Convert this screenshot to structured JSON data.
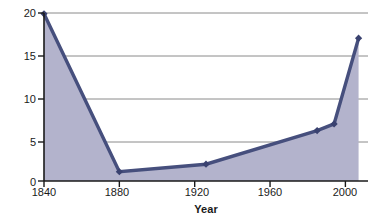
{
  "chart_data": {
    "type": "area",
    "title": "",
    "xlabel": "Year",
    "ylabel": "Percent",
    "x": [
      1840,
      1880,
      1926,
      1985,
      1994,
      2007
    ],
    "values": [
      19.9,
      1.1,
      2.0,
      6.0,
      6.8,
      17.0
    ],
    "series": [
      {
        "name": "Percent",
        "values": [
          19.9,
          1.1,
          2.0,
          6.0,
          6.8,
          17.0
        ]
      }
    ],
    "xlim": [
      1840,
      2012
    ],
    "ylim": [
      0,
      20
    ],
    "x_ticks": [
      1840,
      1880,
      1920,
      1960,
      2000
    ],
    "x_tick_labels": [
      "1840",
      "1880",
      "1920",
      "1960",
      "2000"
    ],
    "y_ticks": [
      0,
      5,
      10,
      15,
      20
    ],
    "y_tick_labels": [
      "0",
      "5",
      "10",
      "15",
      "20"
    ],
    "grid": "horizontal",
    "legend": "none",
    "colors": {
      "line": "#464f7d",
      "fill": "#b3b3cc",
      "marker": "#3a4270",
      "gridline": "#8a8a8a",
      "axis": "#1a1a1a",
      "background": "#ffffff"
    }
  }
}
